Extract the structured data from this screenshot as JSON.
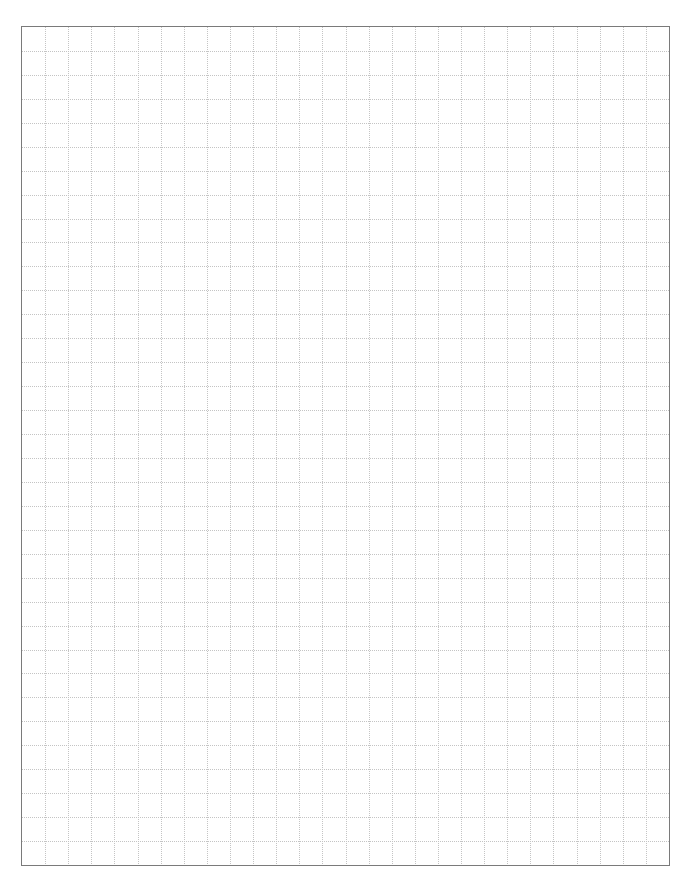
{
  "document": {
    "type": "graph-paper",
    "header_mark": "",
    "grid": {
      "columns": 28,
      "rows": 35,
      "line_style": "dotted",
      "line_color": "#c4c4c4",
      "border_color": "#7a7a7a",
      "background_color": "#ffffff"
    }
  }
}
